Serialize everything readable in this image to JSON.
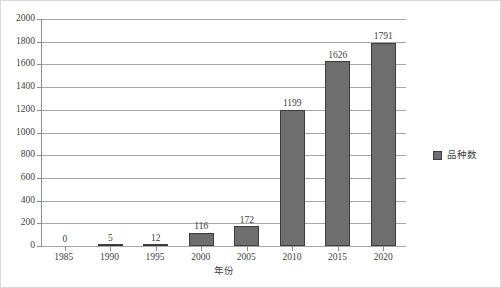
{
  "chart_data": {
    "type": "bar",
    "title": "",
    "xlabel": "年份",
    "ylabel": "",
    "categories": [
      "1985",
      "1990",
      "1995",
      "2000",
      "2005",
      "2010",
      "2015",
      "2020"
    ],
    "values": [
      0,
      5,
      12,
      116,
      172,
      1199,
      1626,
      1791
    ],
    "series": [
      {
        "name": "品种数",
        "values": [
          0,
          5,
          12,
          116,
          172,
          1199,
          1626,
          1791
        ],
        "color": "#6E6E6E"
      }
    ],
    "ylim": [
      0,
      2000
    ],
    "ytick_step": 200,
    "yticks": [
      "0",
      "200",
      "400",
      "600",
      "800",
      "1000",
      "1200",
      "1400",
      "1600",
      "1800",
      "2000"
    ],
    "grid": true,
    "legend": {
      "position": "right",
      "entries": [
        {
          "label": "品种数",
          "color": "#6E6E6E"
        }
      ]
    },
    "colors": {
      "bar_fill": "#6E6E6E",
      "bar_border": "#3C3C3C",
      "gridline": "#A6A6A6",
      "axis": "#8C8C8C",
      "text": "#3F3F3F",
      "frame": "#D9D9D9",
      "background": "#FFFFFF"
    }
  }
}
